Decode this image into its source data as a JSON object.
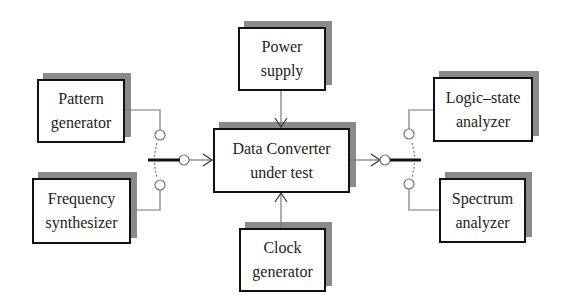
{
  "diagram": {
    "boxes": [
      {
        "id": "pattern",
        "line1": "Pattern",
        "line2": "generator",
        "x": 37,
        "y": 79,
        "w": 88,
        "h": 64
      },
      {
        "id": "frequency",
        "line1": "Frequency",
        "line2": "synthesizer",
        "x": 32,
        "y": 178,
        "w": 99,
        "h": 66
      },
      {
        "id": "power",
        "line1": "Power",
        "line2": "supply",
        "x": 238,
        "y": 27,
        "w": 88,
        "h": 64
      },
      {
        "id": "dut",
        "line1": "Data Converter",
        "line2": "under test",
        "x": 213,
        "y": 128,
        "w": 137,
        "h": 65
      },
      {
        "id": "clock",
        "line1": "Clock",
        "line2": "generator",
        "x": 239,
        "y": 228,
        "w": 87,
        "h": 64
      },
      {
        "id": "logic",
        "line1": "Logic–state",
        "line2": "analyzer",
        "x": 433,
        "y": 77,
        "w": 100,
        "h": 65
      },
      {
        "id": "spectrum",
        "line1": "Spectrum",
        "line2": "analyzer",
        "x": 439,
        "y": 178,
        "w": 87,
        "h": 65
      }
    ],
    "colors": {
      "line": "#777777",
      "border": "#111111",
      "shadow": "#8a8a8a"
    }
  }
}
